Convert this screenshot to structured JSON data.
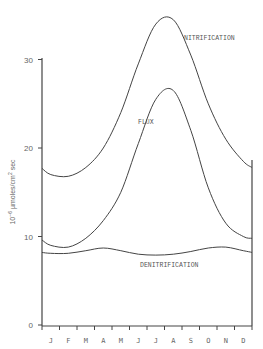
{
  "chart_data": {
    "type": "line",
    "title": "",
    "xlabel": "",
    "ylabel": "10^-6 µmoles/cm² sec",
    "ylabel_parts": {
      "base": "10",
      "exp": "−6",
      "unit": " µmoles/cm",
      "unit_exp": "2",
      "tail": " sec"
    },
    "categories": [
      "J",
      "F",
      "M",
      "A",
      "M",
      "J",
      "J",
      "A",
      "S",
      "O",
      "N",
      "D"
    ],
    "yticks": [
      0,
      10,
      20,
      30
    ],
    "ylim": [
      0,
      36
    ],
    "grid": false,
    "legend": "inline labels",
    "series": [
      {
        "name": "NITRIFICATION",
        "values": [
          17.0,
          16.8,
          17.8,
          20.0,
          24.0,
          29.5,
          34.0,
          34.5,
          30.5,
          25.0,
          21.0,
          18.5
        ]
      },
      {
        "name": "FLUX",
        "values": [
          9.0,
          8.8,
          9.8,
          11.8,
          15.0,
          20.5,
          25.5,
          26.5,
          22.0,
          15.5,
          11.5,
          10.0
        ]
      },
      {
        "name": "DENITRIFICATION",
        "values": [
          8.1,
          8.1,
          8.4,
          8.7,
          8.4,
          8.0,
          7.9,
          8.0,
          8.3,
          8.7,
          8.8,
          8.4
        ]
      }
    ],
    "start_values": {
      "NITRIFICATION": 17.7,
      "FLUX": 9.6,
      "DENITRIFICATION": 8.2
    },
    "end_values": {
      "NITRIFICATION": 17.8,
      "FLUX": 9.8,
      "DENITRIFICATION": 8.2
    }
  }
}
